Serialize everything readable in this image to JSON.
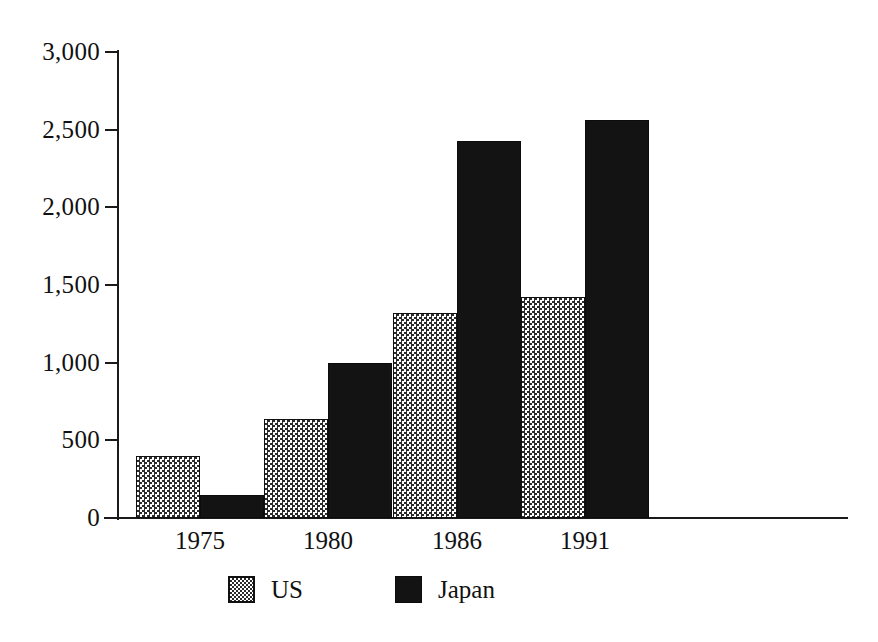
{
  "chart_data": {
    "type": "bar",
    "title": "",
    "subtitle": "",
    "xlabel": "",
    "ylabel": "",
    "categories": [
      "1975",
      "1980",
      "1986",
      "1991"
    ],
    "series": [
      {
        "name": "US",
        "pattern": "checkered",
        "color": "#d9d9d9",
        "values": [
          400,
          640,
          1320,
          1420
        ]
      },
      {
        "name": "Japan",
        "pattern": "solid",
        "color": "#131313",
        "values": [
          150,
          1000,
          2430,
          2560
        ]
      }
    ],
    "ylim": [
      0,
      3000
    ],
    "yticks": [
      0,
      500,
      1000,
      1500,
      2000,
      2500,
      3000
    ],
    "ytick_labels": [
      "0",
      "500",
      "1,000",
      "1,500",
      "2,000",
      "2,500",
      "3,000"
    ],
    "grid": false,
    "legend_position": "bottom"
  },
  "axes": {
    "y_tick_labels": [
      "3,000",
      "2,500",
      "2,000",
      "1,500",
      "1,000",
      "500",
      "0"
    ],
    "x_tick_labels": [
      "1975",
      "1980",
      "1986",
      "1991"
    ]
  },
  "legend": {
    "entries": [
      {
        "label": "US",
        "swatch": "checkered-swatch-icon"
      },
      {
        "label": "Japan",
        "swatch": "solid-black-swatch-icon"
      }
    ]
  }
}
